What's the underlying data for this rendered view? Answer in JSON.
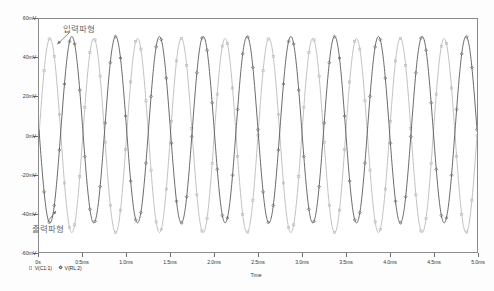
{
  "chart_data": {
    "type": "line",
    "title": "",
    "xlabel": "Time",
    "ylabel": "",
    "xlim": [
      0,
      0.005
    ],
    "ylim": [
      -60,
      60
    ],
    "grid": false,
    "legend_position": "bottom-left",
    "x_tick_labels": [
      "0s",
      "0.5ms",
      "1.0ms",
      "1.5ms",
      "2.0ms",
      "2.5ms",
      "3.0ms",
      "3.5ms",
      "4.0ms",
      "4.5ms",
      "5.0ms"
    ],
    "x_tick_values": [
      0,
      0.0005,
      0.001,
      0.0015,
      0.002,
      0.0025,
      0.003,
      0.0035,
      0.004,
      0.0045,
      0.005
    ],
    "y_tick_labels": [
      "60mV",
      "40mV",
      "20mV",
      "0mV",
      "-20mV",
      "-40mV",
      "-60mV"
    ],
    "y_tick_values": [
      60,
      40,
      20,
      0,
      -20,
      -40,
      -60
    ],
    "series": [
      {
        "name": "V(C1:1)",
        "legend_label": "V(C1:1)",
        "marker": "square",
        "color": "#b9b9b9",
        "amplitude_mv": 50,
        "frequency_hz": 2000,
        "phase_deg": 0,
        "offset_mv": 0,
        "annotation": "입력파형"
      },
      {
        "name": "V(RL:2)",
        "legend_label": "V(RL:2)",
        "marker": "diamond",
        "color": "#585858",
        "amplitude_mv": 48,
        "frequency_hz": 2000,
        "phase_deg": 180,
        "offset_mv": 3,
        "annotation": "출력파형"
      }
    ],
    "annotations": [
      {
        "text": "입력파형",
        "points_to_series": "V(C1:1)",
        "color": "#6b6b6b"
      },
      {
        "text": "출력파형",
        "points_to_series": "V(RL:2)",
        "color": "#6b6b6b"
      }
    ]
  },
  "axes": {
    "x_title": "Time",
    "frame_color": "#8b8b8b"
  },
  "legend": {
    "entries": [
      {
        "label": "V(C1:1)",
        "marker": "square"
      },
      {
        "label": "V(RL:2)",
        "marker": "diamond"
      }
    ]
  },
  "annotations": {
    "input_waveform": "입력파형",
    "output_waveform": "출력파형"
  },
  "colors": {
    "trace_input": "#b9b9b9",
    "trace_output": "#585858",
    "frame": "#8b8b8b",
    "tick_text": "#3a3a3a",
    "annotation_text": "#6b6b6b",
    "background": "#ffffff"
  }
}
